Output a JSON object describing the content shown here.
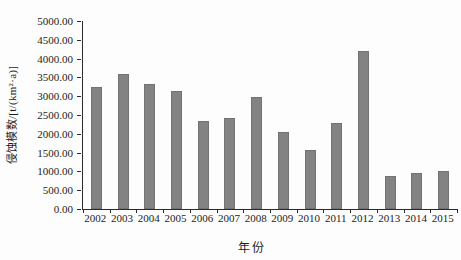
{
  "figure": {
    "background_color": "#fdfdfd",
    "axis_color": "#2b2b2b",
    "text_color": "#1c1c1c"
  },
  "chart_data": {
    "type": "bar",
    "title": "",
    "xlabel": "年份",
    "ylabel": "侵蚀模数/[t/(km²·a)]",
    "categories": [
      "2002",
      "2003",
      "2004",
      "2005",
      "2006",
      "2007",
      "2008",
      "2009",
      "2010",
      "2011",
      "2012",
      "2013",
      "2014",
      "2015"
    ],
    "values": [
      3250,
      3580,
      3330,
      3140,
      2330,
      2430,
      2970,
      2040,
      1570,
      2300,
      4210,
      890,
      950,
      1020
    ],
    "ylim": [
      0,
      5000
    ],
    "ytick_step": 500,
    "ytick_labels_top_to_bottom": [
      "5000.00",
      "4500.00",
      "4000.00",
      "3500.00",
      "3000.00",
      "2500.00",
      "2000.00",
      "1500.00",
      "1000.00",
      "500.00",
      "0.00"
    ],
    "grid": false,
    "legend": "none",
    "bar_color": "#838383"
  }
}
